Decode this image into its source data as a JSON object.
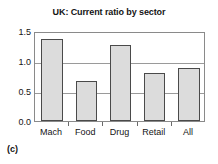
{
  "figure": {
    "title": "UK: Current ratio by sector",
    "panel_caption": "(c)",
    "bar_fill_color": "#dcdcdc",
    "bar_edge_color": "#4a4a4a",
    "grid_color": "#9a9a9a",
    "frame_color": "#8a8a8a",
    "background_color": "#ffffff"
  },
  "chart_data": {
    "type": "bar",
    "title": "UK: Current ratio by sector",
    "xlabel": "",
    "ylabel": "",
    "categories": [
      "Mach",
      "Food",
      "Drug",
      "Retail",
      "All"
    ],
    "values": [
      1.37,
      0.67,
      1.27,
      0.8,
      0.88
    ],
    "series": [
      {
        "name": "Current ratio",
        "values": [
          1.37,
          0.67,
          1.27,
          0.8,
          0.88
        ]
      }
    ],
    "ylim": [
      0.0,
      1.5
    ],
    "yticks": [
      0.0,
      0.5,
      1.0,
      1.5
    ],
    "ytick_labels": [
      "0.0",
      "0.5",
      "1.0",
      "1.5"
    ],
    "xtick_labels": [
      "Mach",
      "Food",
      "Drug",
      "Retail",
      "All"
    ],
    "grid": true,
    "grid_axis": "y",
    "legend": false,
    "legend_position": "none",
    "annotations": [
      "(c)"
    ]
  }
}
